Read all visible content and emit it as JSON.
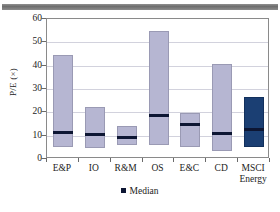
{
  "chart_data": {
    "type": "bar",
    "title": "",
    "subtitle": "",
    "xlabel": "",
    "ylabel": "P/E (×)",
    "ylim": [
      0,
      60
    ],
    "ytick_values": [
      0,
      10,
      20,
      30,
      40,
      50,
      60
    ],
    "ytick_labels": [
      "0",
      "10",
      "20",
      "30",
      "40",
      "50",
      "60"
    ],
    "grid": true,
    "legend_position": "bottom-center",
    "legend": [
      {
        "label": "Median",
        "marker": "square",
        "color": "#0d1633"
      }
    ],
    "categories": [
      "E&P",
      "IO",
      "R&M",
      "OS",
      "E&C",
      "CD",
      "MSCI Energy"
    ],
    "series": [
      {
        "name": "P/E range (low to high)",
        "type": "range-bar",
        "low": [
          5.0,
          4.7,
          5.8,
          5.9,
          5.2,
          3.3,
          5.3
        ],
        "high": [
          44.7,
          22.4,
          14.3,
          55.0,
          19.9,
          40.6,
          26.6
        ],
        "colors": [
          "#b6b6d2",
          "#b6b6d2",
          "#b6b6d2",
          "#b6b6d2",
          "#b6b6d2",
          "#b6b6d2",
          "#1b3f73"
        ]
      },
      {
        "name": "Median",
        "type": "marker-line",
        "values": [
          11.9,
          10.8,
          9.8,
          19.2,
          15.2,
          11.3,
          13.1
        ],
        "color": "#0d1633"
      }
    ]
  },
  "axis": {
    "y_title": "P/E (×)"
  },
  "xaxis": {
    "labels": [
      {
        "line1": "E&P",
        "line2": ""
      },
      {
        "line1": "IO",
        "line2": ""
      },
      {
        "line1": "R&M",
        "line2": ""
      },
      {
        "line1": "OS",
        "line2": ""
      },
      {
        "line1": "E&C",
        "line2": ""
      },
      {
        "line1": "CD",
        "line2": ""
      },
      {
        "line1": "MSCI",
        "line2": "Energy"
      }
    ]
  },
  "legend": {
    "median_label": "Median"
  },
  "colors": {
    "bar_light": "#b6b6d2",
    "bar_dark": "#1b3f73",
    "median": "#0d1633",
    "grid": "#d2d2dd",
    "frame": "#8a8a8a",
    "top_bar": "#7a7a7a"
  }
}
